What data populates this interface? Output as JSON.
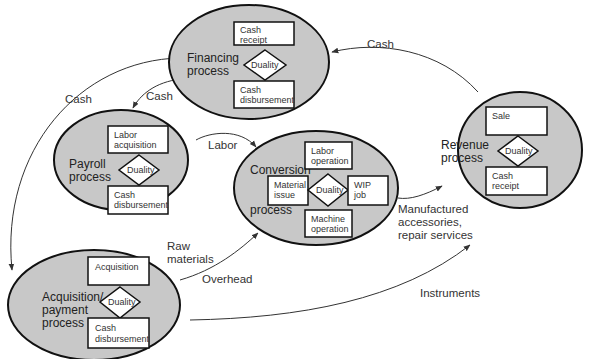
{
  "diagram": {
    "colors": {
      "ellipse_fill": "#c8c8c8",
      "stroke": "#111111",
      "box_fill": "#ffffff",
      "arrow": "#333333"
    },
    "processes": {
      "financing": {
        "label_lines": [
          "Financing",
          "process"
        ],
        "top_box": [
          "Cash",
          "receipt"
        ],
        "bottom_box": [
          "Cash",
          "disbursement"
        ],
        "duality": "Duality"
      },
      "payroll": {
        "label_lines": [
          "Payroll",
          "process"
        ],
        "top_box": [
          "Labor",
          "acquisition"
        ],
        "bottom_box": [
          "Cash",
          "disbursement"
        ],
        "duality": "Duality"
      },
      "conversion": {
        "label_lines": [
          "Conversion",
          "process"
        ],
        "top_box": [
          "Labor",
          "operation"
        ],
        "left_box": [
          "Material",
          "issue"
        ],
        "right_box": [
          "WIP",
          "job"
        ],
        "bottom_box": [
          "Machine",
          "operation"
        ],
        "duality": "Duality"
      },
      "revenue": {
        "label_lines": [
          "Revenue",
          "process"
        ],
        "top_box": [
          "Sale"
        ],
        "bottom_box": [
          "Cash",
          "receipt"
        ],
        "duality": "Duality"
      },
      "acquisition": {
        "label_lines": [
          "Acquisition/",
          "payment",
          "process"
        ],
        "top_box": [
          "Acquisition"
        ],
        "bottom_box": [
          "Cash",
          "disbursement"
        ],
        "duality": "Duality"
      }
    },
    "flows": {
      "revenue_to_financing": "Cash",
      "financing_to_acquisition": "Cash",
      "financing_to_payroll": "Cash",
      "payroll_to_conversion": "Labor",
      "conversion_to_revenue": [
        "Manufactured",
        "accessories,",
        "repair services"
      ],
      "acquisition_to_conversion_raw": [
        "Raw",
        "materials"
      ],
      "acquisition_to_conversion_overhead": "Overhead",
      "acquisition_to_revenue": "Instruments"
    }
  }
}
